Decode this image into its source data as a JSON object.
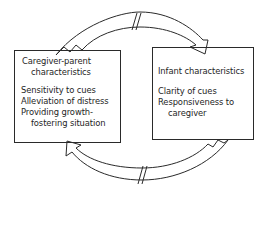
{
  "diagram": {
    "left_box": {
      "title_line1": "Caregiver-parent",
      "title_line2": "characteristics",
      "items": [
        "Sensitivity to cues",
        "Alleviation of distress",
        "Providing growth-",
        "fostering situation"
      ]
    },
    "right_box": {
      "title": "Infant characteristics",
      "items": [
        "Clarity of cues",
        "Responsiveness to",
        "caregiver"
      ]
    },
    "arrows": [
      {
        "from": "left_box",
        "to": "right_box",
        "position": "top",
        "break_mark": "//"
      },
      {
        "from": "right_box",
        "to": "left_box",
        "position": "bottom",
        "break_mark": "//"
      }
    ],
    "colors": {
      "line": "#2a2a2a",
      "background": "#ffffff"
    }
  }
}
